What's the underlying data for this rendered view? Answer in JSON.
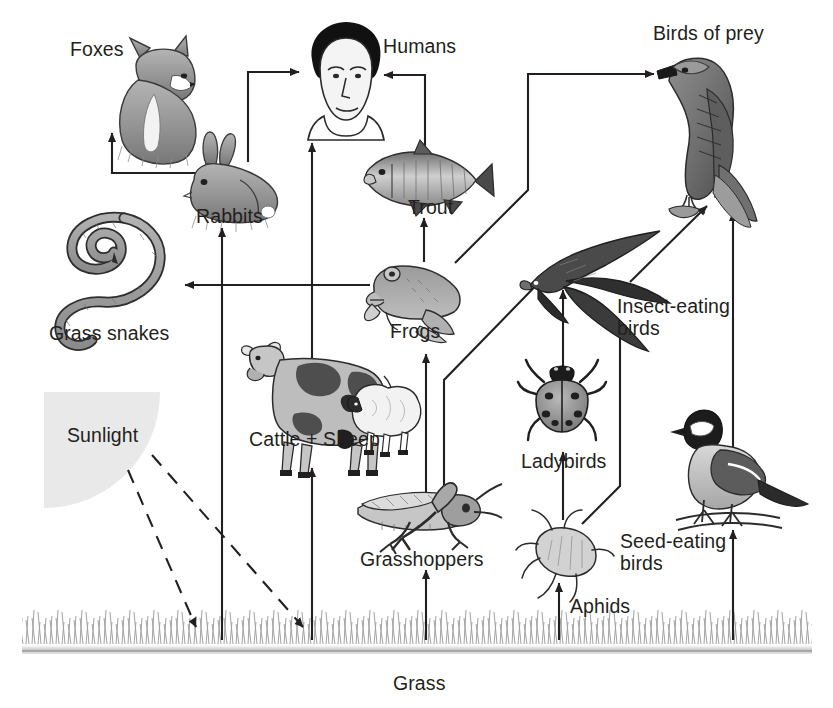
{
  "diagram": {
    "type": "food-web",
    "background": "#ffffff",
    "ink": "#231f20",
    "sunlight_fill": "#e9e9e9"
  },
  "nodes": [
    {
      "id": "foxes",
      "label": "Foxes",
      "label_x": 70,
      "label_y": 38,
      "trophic": "predator"
    },
    {
      "id": "humans",
      "label": "Humans",
      "label_x": 383,
      "label_y": 35,
      "trophic": "consumer"
    },
    {
      "id": "birdsofprey",
      "label": "Birds of prey",
      "label_x": 653,
      "label_y": 22,
      "trophic": "top-predator"
    },
    {
      "id": "rabbits",
      "label": "Rabbits",
      "label_x": 196,
      "label_y": 205,
      "trophic": "herbivore"
    },
    {
      "id": "trout",
      "label": "Trout",
      "label_x": 408,
      "label_y": 196,
      "trophic": "consumer"
    },
    {
      "id": "grasssnakes",
      "label": "Grass snakes",
      "label_x": 49,
      "label_y": 322,
      "trophic": "predator"
    },
    {
      "id": "frogs",
      "label": "Frogs",
      "label_x": 390,
      "label_y": 320,
      "trophic": "predator"
    },
    {
      "id": "insectbirds",
      "label": "Insect-eating\nbirds",
      "label_x": 617,
      "label_y": 295,
      "trophic": "consumer"
    },
    {
      "id": "cattlesheep",
      "label": "Cattle + Sheep",
      "label_x": 249,
      "label_y": 428,
      "trophic": "herbivore"
    },
    {
      "id": "ladybirds",
      "label": "Ladybirds",
      "label_x": 521,
      "label_y": 450,
      "trophic": "predator"
    },
    {
      "id": "sunlight",
      "label": "Sunlight",
      "label_x": 67,
      "label_y": 424,
      "trophic": "energy-source"
    },
    {
      "id": "seedbirds",
      "label": "Seed-eating\nbirds",
      "label_x": 620,
      "label_y": 530,
      "trophic": "consumer"
    },
    {
      "id": "grasshoppers",
      "label": "Grasshoppers",
      "label_x": 360,
      "label_y": 548,
      "trophic": "herbivore"
    },
    {
      "id": "aphids",
      "label": "Aphids",
      "label_x": 570,
      "label_y": 595,
      "trophic": "herbivore"
    },
    {
      "id": "grass",
      "label": "Grass",
      "label_x": 393,
      "label_y": 672,
      "trophic": "producer"
    }
  ],
  "edges": [
    {
      "from": "grass",
      "to": "rabbits",
      "style": "solid"
    },
    {
      "from": "grass",
      "to": "cattlesheep",
      "style": "solid"
    },
    {
      "from": "grass",
      "to": "grasshoppers",
      "style": "solid"
    },
    {
      "from": "grass",
      "to": "aphids",
      "style": "solid"
    },
    {
      "from": "grass",
      "to": "seedbirds",
      "style": "solid"
    },
    {
      "from": "rabbits",
      "to": "foxes",
      "style": "solid"
    },
    {
      "from": "rabbits",
      "to": "humans",
      "style": "solid"
    },
    {
      "from": "cattlesheep",
      "to": "humans",
      "style": "solid"
    },
    {
      "from": "trout",
      "to": "humans",
      "style": "solid"
    },
    {
      "from": "frogs",
      "to": "trout",
      "style": "solid"
    },
    {
      "from": "frogs",
      "to": "grasssnakes",
      "style": "solid"
    },
    {
      "from": "frogs",
      "to": "birdsofprey",
      "style": "solid"
    },
    {
      "from": "grasshoppers",
      "to": "frogs",
      "style": "solid"
    },
    {
      "from": "grasshoppers",
      "to": "insectbirds",
      "style": "solid"
    },
    {
      "from": "aphids",
      "to": "ladybirds",
      "style": "solid"
    },
    {
      "from": "aphids",
      "to": "insectbirds",
      "style": "solid"
    },
    {
      "from": "ladybirds",
      "to": "insectbirds",
      "style": "solid"
    },
    {
      "from": "insectbirds",
      "to": "birdsofprey",
      "style": "solid"
    },
    {
      "from": "seedbirds",
      "to": "birdsofprey",
      "style": "solid"
    },
    {
      "from": "sunlight",
      "to": "grass",
      "style": "dashed"
    },
    {
      "from": "sunlight",
      "to": "grass",
      "style": "dashed"
    }
  ]
}
